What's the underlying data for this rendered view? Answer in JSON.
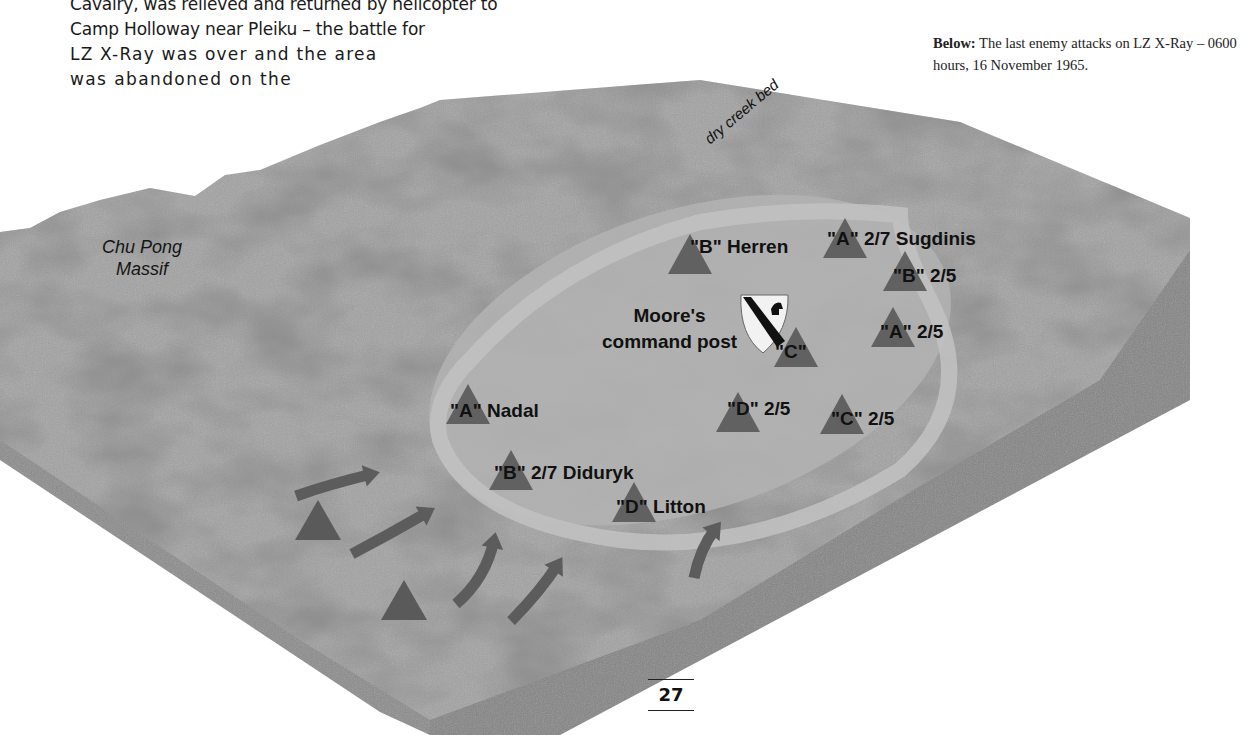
{
  "body_text": {
    "lines": [
      "Cavalry, was relieved and returned by helicopter to",
      "Camp Holloway near Pleiku – the battle for",
      "LZ X-Ray was over and the area",
      "was abandoned on the"
    ]
  },
  "caption": {
    "lead": "Below:",
    "text": " The last enemy attacks on LZ X-Ray – 0600 hours, 16 November 1965."
  },
  "map": {
    "terrain_color": "#9a9a9a",
    "clearing_color": "#b4b4b4",
    "side_color": "#8a8a8a",
    "marker_color": "#5a5a5a",
    "arrow_color": "#5c5c5c",
    "place_labels": {
      "chu_pong": "Chu Pong\nMassif",
      "creek": "dry creek bed"
    },
    "command_post": {
      "label_line1": "Moore's",
      "label_line2": "command post",
      "icon": "1st-cavalry-shield-icon"
    },
    "units": [
      {
        "id": "b-herren",
        "letter": "\"B\"",
        "name": " Herren",
        "x": 690,
        "y": 236,
        "tri_x": 690,
        "tri_y": 234
      },
      {
        "id": "a-sugdinis",
        "letter": "\"A\"",
        "name": " 2/7 Sugdinis",
        "x": 827,
        "y": 228,
        "tri_x": 845,
        "tri_y": 218
      },
      {
        "id": "b-2-5",
        "letter": "\"B\"",
        "name": " 2/5",
        "x": 893,
        "y": 265,
        "tri_x": 905,
        "tri_y": 251
      },
      {
        "id": "a-2-5",
        "letter": "\"A\"",
        "name": " 2/5",
        "x": 880,
        "y": 321,
        "tri_x": 893,
        "tri_y": 307
      },
      {
        "id": "c-cp",
        "letter": "\"C\"",
        "name": "",
        "x": 775,
        "y": 341,
        "tri_x": 796,
        "tri_y": 327
      },
      {
        "id": "a-nadal",
        "letter": "\"A\"",
        "name": " Nadal",
        "x": 450,
        "y": 400,
        "tri_x": 468,
        "tri_y": 384
      },
      {
        "id": "d-2-5",
        "letter": "\"D\"",
        "name": " 2/5",
        "x": 727,
        "y": 398,
        "tri_x": 738,
        "tri_y": 392
      },
      {
        "id": "c-2-5",
        "letter": "\"C\"",
        "name": " 2/5",
        "x": 831,
        "y": 408,
        "tri_x": 842,
        "tri_y": 394
      },
      {
        "id": "b-didurky",
        "letter": "\"B\"",
        "name": " 2/7 Diduryk",
        "x": 494,
        "y": 462,
        "tri_x": 511,
        "tri_y": 450
      },
      {
        "id": "d-litton",
        "letter": "\"D\"",
        "name": " Litton",
        "x": 616,
        "y": 496,
        "tri_x": 634,
        "tri_y": 482
      }
    ],
    "enemy_markers": [
      {
        "x": 318,
        "y": 500
      },
      {
        "x": 404,
        "y": 580
      }
    ],
    "attack_arrows": [
      {
        "d": "M296 496 Q330 484 372 474"
      },
      {
        "d": "M352 554 Q390 534 428 512"
      },
      {
        "d": "M456 604 Q486 578 494 540"
      },
      {
        "d": "M511 621 Q540 592 558 564"
      },
      {
        "d": "M694 578 Q700 548 716 528"
      }
    ]
  },
  "page_number": "27"
}
